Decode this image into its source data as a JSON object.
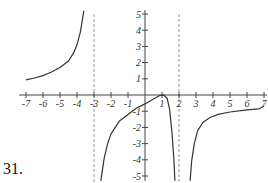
{
  "problem_number": "31.",
  "chart_data": {
    "type": "line",
    "title": "",
    "xlabel": "",
    "ylabel": "",
    "xlim": [
      -7,
      7
    ],
    "ylim": [
      -5,
      5
    ],
    "x_ticks": [
      -7,
      -6,
      -5,
      -4,
      -3,
      -2,
      -1,
      1,
      2,
      3,
      4,
      5,
      6,
      7
    ],
    "x_tick_labels": [
      "-7",
      "-6",
      "-5",
      "-4",
      "-3",
      "-2",
      "-1",
      "1",
      "2",
      "3",
      "4",
      "5",
      "6",
      "7"
    ],
    "y_ticks": [
      5,
      4,
      3,
      2,
      1,
      -1,
      -2,
      -3,
      -4,
      -5
    ],
    "y_tick_labels": [
      "5",
      "4",
      "3",
      "2",
      "1",
      "-1",
      "-2",
      "-3",
      "-4",
      "-5"
    ],
    "grid": false,
    "vertical_asymptotes": [
      -3,
      2
    ],
    "series": [
      {
        "name": "left-branch",
        "points": [
          [
            -7,
            0.93
          ],
          [
            -6.5,
            1.05
          ],
          [
            -6,
            1.2
          ],
          [
            -5.5,
            1.42
          ],
          [
            -5,
            1.7
          ],
          [
            -4.5,
            2.1
          ],
          [
            -4.2,
            2.6
          ],
          [
            -4,
            3.1
          ],
          [
            -3.8,
            3.9
          ],
          [
            -3.6,
            5.2
          ]
        ]
      },
      {
        "name": "middle-branch",
        "points": [
          [
            -2.6,
            -5.3
          ],
          [
            -2.4,
            -3.9
          ],
          [
            -2.2,
            -3.0
          ],
          [
            -2,
            -2.4
          ],
          [
            -1.5,
            -1.6
          ],
          [
            -1,
            -1.2
          ],
          [
            -0.5,
            -0.8
          ],
          [
            0,
            -0.55
          ],
          [
            0.5,
            -0.25
          ],
          [
            0.9,
            -0.02
          ],
          [
            1.1,
            0.0
          ],
          [
            1.3,
            -0.2
          ],
          [
            1.45,
            -0.9
          ],
          [
            1.6,
            -2.5
          ],
          [
            1.7,
            -4.0
          ],
          [
            1.76,
            -5.3
          ]
        ]
      },
      {
        "name": "right-branch",
        "points": [
          [
            2.65,
            -5.3
          ],
          [
            2.75,
            -4.0
          ],
          [
            2.9,
            -3.0
          ],
          [
            3.1,
            -2.2
          ],
          [
            3.4,
            -1.7
          ],
          [
            3.8,
            -1.4
          ],
          [
            4.3,
            -1.2
          ],
          [
            5,
            -1.05
          ],
          [
            6,
            -0.92
          ],
          [
            6.7,
            -0.85
          ],
          [
            7,
            -0.7
          ]
        ]
      }
    ]
  }
}
